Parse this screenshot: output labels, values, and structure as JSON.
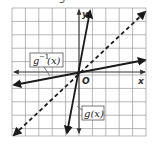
{
  "problem_number": "5",
  "graph": {
    "x_axis_label": "x",
    "y_axis_label": "y",
    "origin_label": "O",
    "grid": {
      "columns": 10,
      "rows": 10,
      "color": "#9a9a9a"
    },
    "lines": [
      {
        "name": "g(x)",
        "label": "g(x)",
        "style": "solid",
        "color": "#1a1a1a",
        "description": "steep line through origin"
      },
      {
        "name": "g^-1(x)",
        "label": "g⁻¹(x)",
        "style": "solid",
        "color": "#1a1a1a",
        "description": "shallow line through origin"
      },
      {
        "name": "y=x",
        "label": "",
        "style": "dashed",
        "color": "#1a1a1a",
        "description": "line of reflection y = x"
      }
    ]
  }
}
